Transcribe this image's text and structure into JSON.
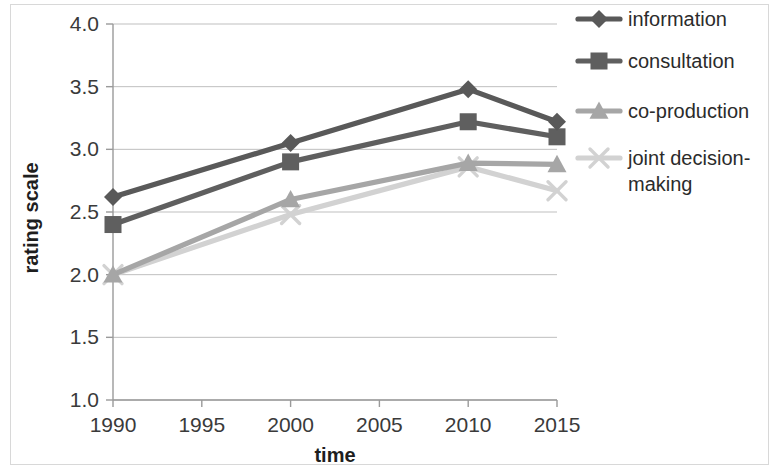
{
  "chart_data": {
    "type": "line",
    "title": "",
    "xlabel": "time",
    "ylabel": "rating scale",
    "x": [
      1990,
      2000,
      2010,
      2015
    ],
    "xlim": [
      1990,
      2015
    ],
    "ylim": [
      1.0,
      4.0
    ],
    "xticks": [
      "1990",
      "1995",
      "2000",
      "2005",
      "2010",
      "2015"
    ],
    "xtick_values": [
      1990,
      1995,
      2000,
      2005,
      2010,
      2015
    ],
    "yticks": [
      "1.0",
      "1.5",
      "2.0",
      "2.5",
      "3.0",
      "3.5",
      "4.0"
    ],
    "ytick_values": [
      1.0,
      1.5,
      2.0,
      2.5,
      3.0,
      3.5,
      4.0
    ],
    "grid": "horizontal",
    "legend_position": "right",
    "series": [
      {
        "name": "information",
        "marker": "diamond",
        "color": "#595959",
        "values": [
          2.62,
          3.05,
          3.48,
          3.22
        ]
      },
      {
        "name": "consultation",
        "marker": "square",
        "color": "#5f5f5f",
        "values": [
          2.4,
          2.9,
          3.22,
          3.1
        ]
      },
      {
        "name": "co-production",
        "marker": "triangle",
        "color": "#a6a6a6",
        "values": [
          2.0,
          2.6,
          2.89,
          2.88
        ]
      },
      {
        "name": "joint decision-making",
        "marker": "x",
        "color": "#d2d2d2",
        "values": [
          2.0,
          2.48,
          2.86,
          2.67
        ]
      }
    ]
  },
  "axes": {
    "x_title": "time",
    "y_title": "rating scale"
  },
  "legend": {
    "items": [
      {
        "label": "information"
      },
      {
        "label": "consultation"
      },
      {
        "label": "co-production"
      },
      {
        "label": "joint decision-making",
        "line1": "joint decision-",
        "line2": "making"
      }
    ]
  },
  "colors": {
    "information": "#595959",
    "consultation": "#5f5f5f",
    "co_production": "#a6a6a6",
    "joint_decision_making": "#d2d2d2",
    "gridline": "#bfbfbf",
    "axis": "#9a9a9a",
    "frame": "#d8d8d8",
    "text": "#2b2b2b",
    "background": "#ffffff"
  }
}
